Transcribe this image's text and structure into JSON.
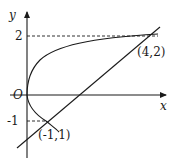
{
  "diagram": {
    "type": "coordinate-graph",
    "axes": {
      "x_label": "x",
      "y_label": "y",
      "origin_label": "O"
    },
    "y_ticks": [
      {
        "value": 2,
        "label": "2"
      },
      {
        "value": -1,
        "label": "-1"
      }
    ],
    "points": [
      {
        "label": "(4,2)",
        "x": 4,
        "y": 2
      },
      {
        "label": "(-1,1)",
        "x": 1,
        "y": -1
      }
    ],
    "curves": [
      {
        "name": "parabola",
        "equation": "y^2 = x",
        "style": "solid"
      },
      {
        "name": "line",
        "equation": "y = x - 2",
        "style": "solid"
      }
    ],
    "guides": [
      {
        "name": "dashed-y2",
        "style": "dashed"
      },
      {
        "name": "dashed-y-1",
        "style": "dashed"
      }
    ],
    "colors": {
      "stroke": "#1a1a1a",
      "background": "#ffffff"
    }
  }
}
